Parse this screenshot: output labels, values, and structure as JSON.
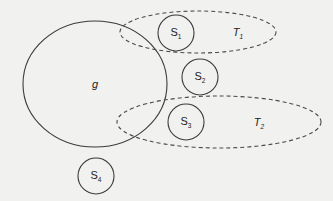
{
  "diagram": {
    "type": "set-diagram",
    "colors": {
      "background": "#f1f1f0",
      "stroke": "#3a3a3a",
      "dashed_stroke": "#4a4a4a",
      "text": "#222222"
    },
    "regions": {
      "g": {
        "label": "g",
        "style": "solid",
        "shape": "ellipse",
        "cx": 95,
        "cy": 84,
        "rx": 72,
        "ry": 63
      },
      "T1": {
        "label": "T",
        "subscript": "1",
        "style": "dashed",
        "shape": "ellipse",
        "cx": 198,
        "cy": 32,
        "rx": 78,
        "ry": 21
      },
      "T2": {
        "label": "T",
        "subscript": "2",
        "style": "dashed",
        "shape": "ellipse",
        "cx": 219,
        "cy": 122,
        "rx": 102,
        "ry": 26
      }
    },
    "nodes": [
      {
        "id": "S1",
        "label": "S",
        "subscript": "1",
        "cx": 176,
        "cy": 33,
        "r": 18
      },
      {
        "id": "S2",
        "label": "S",
        "subscript": "2",
        "cx": 200,
        "cy": 77,
        "r": 18
      },
      {
        "id": "S3",
        "label": "S",
        "subscript": "3",
        "cx": 186,
        "cy": 122,
        "r": 18
      },
      {
        "id": "S4",
        "label": "S",
        "subscript": "4",
        "cx": 96,
        "cy": 176,
        "r": 18
      }
    ],
    "relations": {
      "S1_in": [
        "T1"
      ],
      "S2_in": [],
      "S3_in": [
        "T2"
      ],
      "S4_in": [],
      "g_overlaps": [
        "T1",
        "T2"
      ]
    }
  }
}
